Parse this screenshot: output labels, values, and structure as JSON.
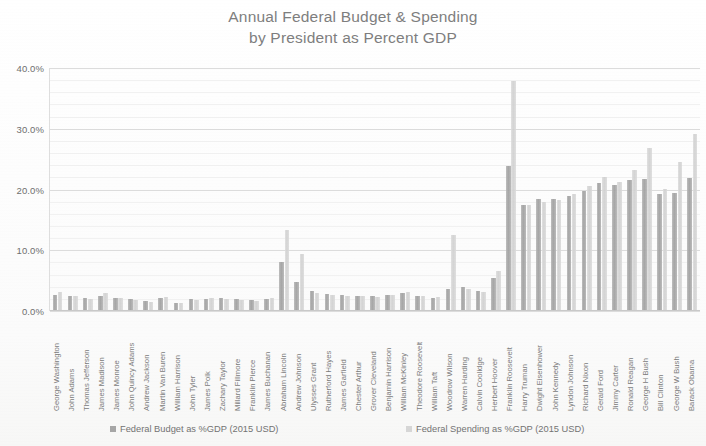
{
  "chart_data": {
    "type": "bar",
    "title": "Annual Federal Budget & Spending",
    "subtitle": "by  President as Percent GDP",
    "title_line1": "Annual Federal Budget & Spending",
    "title_line2": "by  President as Percent GDP",
    "xlabel": "",
    "ylabel": "",
    "ylim": [
      0,
      40
    ],
    "ytick_labels": [
      "0.0%",
      "10.0%",
      "20.0%",
      "30.0%",
      "40.0%"
    ],
    "ytick_values": [
      0,
      10,
      20,
      30,
      40
    ],
    "y_minor_step": 2,
    "grid": true,
    "legend_position": "bottom",
    "legend": [
      "Federal Budget as %GDP (2015 USD)",
      "Federal Spending as %GDP (2015 USD)"
    ],
    "categories": [
      "George Washington",
      "John Adams",
      "Thomas Jefferson",
      "James Madison",
      "James Monroe",
      "John Quincy Adams",
      "Andrew Jackson",
      "Martin Van Buren",
      "William Harrison",
      "John Tyler",
      "James Polk",
      "Zachary Taylor",
      "Millard Fillmore",
      "Franklin Pierce",
      "James Buchanan",
      "Abraham Lincoln",
      "Andrew Johnson",
      "Ulysses Grant",
      "Rutherford Hayes",
      "James Garfield",
      "Chester Arthur",
      "Grover Cleveland",
      "Benjamin Harrison",
      "William McKinley",
      "Theodore Roosevelt",
      "William Taft",
      "Woodrow Wilson",
      "Warren Harding",
      "Calvin Coolidge",
      "Herbert Hoover",
      "Franklin Roosevelt",
      "Harry Truman",
      "Dwight Eisenhower",
      "John Kennedy",
      "Lyndon Johnson",
      "Richard Nixon",
      "Gerald Ford",
      "Jimmy Carter",
      "Ronald Reagan",
      "George H Bush",
      "Bill Clinton",
      "George W Bush",
      "Barack Obama"
    ],
    "series": [
      {
        "name": "Federal Budget as %GDP (2015 USD)",
        "color": "#a6a6a6",
        "values": [
          2.6,
          2.5,
          2.1,
          2.4,
          2.2,
          1.9,
          1.6,
          2.2,
          1.4,
          1.9,
          2.0,
          2.1,
          1.9,
          1.8,
          1.9,
          8.0,
          4.8,
          3.3,
          2.8,
          2.6,
          2.5,
          2.4,
          2.7,
          2.9,
          2.5,
          2.2,
          3.7,
          3.9,
          3.3,
          5.5,
          23.9,
          17.5,
          18.5,
          18.4,
          18.9,
          19.8,
          21.0,
          20.8,
          21.6,
          21.8,
          19.2,
          19.5,
          21.9
        ]
      },
      {
        "name": "Federal Spending as %GDP (2015 USD)",
        "color": "#d6d6d6",
        "values": [
          3.1,
          2.4,
          2.0,
          3.0,
          2.2,
          1.8,
          1.5,
          2.3,
          1.3,
          1.8,
          2.1,
          2.0,
          1.8,
          1.7,
          2.1,
          13.4,
          9.4,
          3.0,
          2.6,
          2.5,
          2.4,
          2.3,
          2.6,
          3.2,
          2.4,
          2.3,
          12.5,
          3.6,
          3.1,
          6.6,
          37.9,
          17.4,
          18.0,
          18.2,
          19.2,
          20.6,
          22.1,
          21.2,
          23.2,
          26.9,
          20.1,
          24.6,
          29.2
        ]
      }
    ]
  },
  "axis": {
    "y_labels": [
      "40.0%",
      "30.0%",
      "20.0%",
      "10.0%",
      "0.0%"
    ]
  }
}
